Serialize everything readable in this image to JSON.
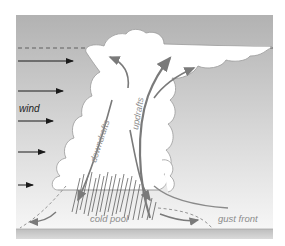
{
  "diagram": {
    "labels": {
      "wind": "wind",
      "downdrafts": "downdrafts",
      "updrafts": "updrafts",
      "cold_pool": "cold pool",
      "gust_front": "gust front"
    },
    "wind_arrows": [
      {
        "y": 61,
        "x1": 18,
        "x2": 73
      },
      {
        "y": 91,
        "x1": 18,
        "x2": 63
      },
      {
        "y": 121,
        "x1": 18,
        "x2": 53
      },
      {
        "y": 152,
        "x1": 18,
        "x2": 45
      },
      {
        "y": 185,
        "x1": 18,
        "x2": 33
      }
    ],
    "colors": {
      "sky_top": "#b4b4b4",
      "sky_bottom": "#f4f4f4",
      "ground": "#cfcfcf",
      "cloud": "#ffffff",
      "cloud_outline": "#8a8a8a",
      "flow_arrow": "#808080",
      "label": "#8c8c8c",
      "wind_label": "#222222",
      "rain": "#555555"
    }
  }
}
